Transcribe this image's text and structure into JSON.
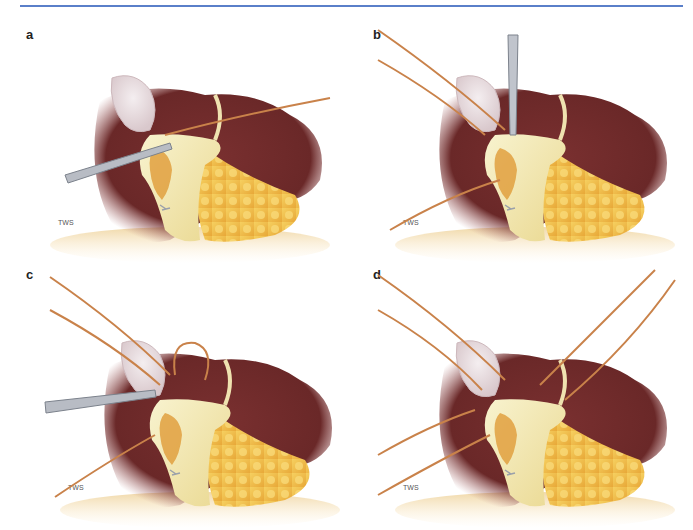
{
  "figure": {
    "header_rule_color": "#5a7fc9",
    "panels": [
      {
        "label": "a",
        "description": "Grasping forceps clamp at duct; single suture passing behind"
      },
      {
        "label": "b",
        "description": "Right-angle clamp vertically; two sutures upper-left, one lower-left"
      },
      {
        "label": "c",
        "description": "Forceps from left; suture loop tied; two upper sutures, one lower"
      },
      {
        "label": "d",
        "description": "Six suture ends retracted in four directions"
      }
    ],
    "signature": "TWS",
    "colors": {
      "liver": "#6e2a2a",
      "liver_light": "#9a4a48",
      "gallbladder": "#e8dfe0",
      "fat": "#f0c24a",
      "fat_dark": "#e0a030",
      "tissue_pale": "#f2ecb8",
      "suture": "#c9824a",
      "instrument": "#b8bcc4",
      "base": "#e9c98c"
    }
  }
}
